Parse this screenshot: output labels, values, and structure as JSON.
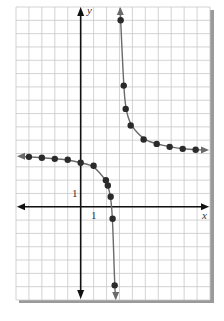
{
  "chart_data": {
    "type": "line",
    "title": "",
    "xlabel": "x",
    "ylabel": "y",
    "xlim": [
      -5,
      10
    ],
    "ylim": [
      -7,
      15
    ],
    "grid": true,
    "grid_step": 1,
    "tick_labels": {
      "x": "1",
      "y": "1"
    },
    "asymptotes": {
      "vertical_x": 3,
      "horizontal_y": 4
    },
    "series": [
      {
        "name": "left-branch",
        "arrow_left": true,
        "arrow_down": true,
        "points": [
          [
            -4,
            3.75
          ],
          [
            -3,
            3.68
          ],
          [
            -2,
            3.6
          ],
          [
            -1,
            3.53
          ],
          [
            0,
            3.3
          ],
          [
            1,
            3.08
          ],
          [
            1.95,
            2.0
          ],
          [
            2.1,
            1.6
          ],
          [
            2.32,
            0.75
          ],
          [
            2.47,
            -0.9
          ],
          [
            2.63,
            -5.9
          ]
        ]
      },
      {
        "name": "right-branch",
        "arrow_up": true,
        "arrow_right": true,
        "points": [
          [
            3.09,
            14.0
          ],
          [
            3.33,
            9.1
          ],
          [
            3.48,
            7.35
          ],
          [
            3.87,
            6.1
          ],
          [
            4.87,
            5.05
          ],
          [
            5.88,
            4.72
          ],
          [
            6.88,
            4.5
          ],
          [
            7.89,
            4.35
          ],
          [
            8.89,
            4.28
          ]
        ]
      }
    ]
  },
  "labels": {
    "x_axis": "x",
    "y_axis": "y",
    "x_tick": "1",
    "y_tick": "1"
  },
  "colors": {
    "grid": "#c8c8c8",
    "axis": "#111111",
    "curve": "#6a6a6a",
    "point": "#2a2a2a",
    "shadow": "#9a9a9a"
  }
}
